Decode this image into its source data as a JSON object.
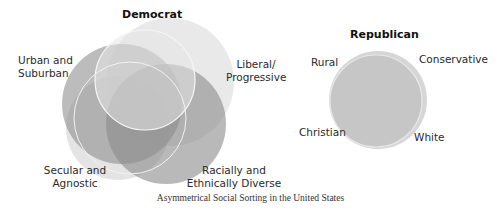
{
  "democrat": {
    "title": "Democrat",
    "labels": {
      "urban": [
        "Urban and",
        "Suburban"
      ],
      "liberal": [
        "Liberal/",
        "Progressive"
      ],
      "secular": [
        "Secular and",
        "Agnostic"
      ],
      "diverse": [
        "Racially and",
        "Ethnically Diverse"
      ]
    }
  },
  "republican": {
    "title": "Republican",
    "labels": {
      "rural": "Rural",
      "conservative": "Conservative",
      "christian": "Christian",
      "white": "White"
    }
  },
  "caption": "Asymmetrical Social Sorting in the United States",
  "colors": {
    "dark_circle": "#8c8c8c",
    "mid_circle": "#b5b5b5",
    "light_circle": "#dcdcdc",
    "republican_fill": "#c4c4c4",
    "outline": "#f4f4f4"
  }
}
